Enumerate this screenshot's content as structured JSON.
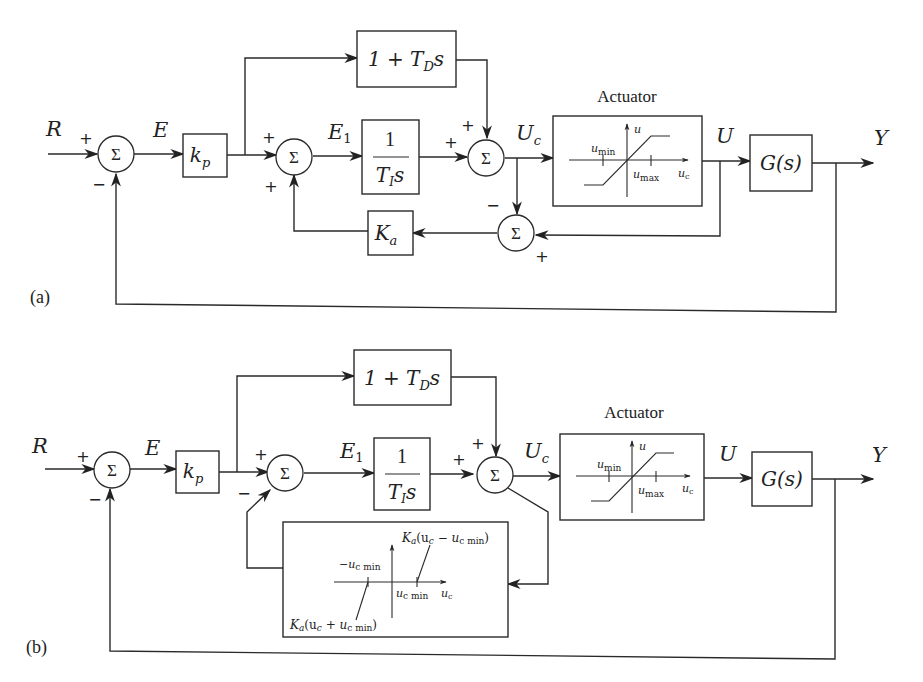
{
  "panels": [
    {
      "id": "a",
      "label": "(a)",
      "signals": {
        "input": "R",
        "error": "E",
        "error1": "E",
        "error1_sub": "1",
        "control": "U",
        "control_sub": "c",
        "actuator_out": "U",
        "output": "Y"
      },
      "blocks": {
        "gain": {
          "main": "k",
          "sub": "p"
        },
        "derivative": {
          "pre": "1 + T",
          "sub": "D",
          "post": "s"
        },
        "integrator": {
          "num": "1",
          "den": "T",
          "den_sub": "I",
          "den_post": "s"
        },
        "antiwindup": {
          "main": "K",
          "sub": "a"
        },
        "plant": "G(s)",
        "actuator": {
          "title": "Actuator",
          "y_axis": "u",
          "x_axis": "u",
          "x_axis_sub": "c",
          "min_label": "u",
          "min_sub": "min",
          "max_label": "u",
          "max_sub": "max"
        }
      },
      "sum_symbol": "Σ",
      "signs": {
        "sum1_in": "+",
        "sum1_fb": "−",
        "sum2_in": "+",
        "sum2_fb": "+",
        "sum3_in1": "+",
        "sum3_in2": "+",
        "sum4_uc": "−",
        "sum4_u": "+"
      }
    },
    {
      "id": "b",
      "label": "(b)",
      "signals": {
        "input": "R",
        "error": "E",
        "error1": "E",
        "error1_sub": "1",
        "control": "U",
        "control_sub": "c",
        "actuator_out": "U",
        "output": "Y"
      },
      "blocks": {
        "gain": {
          "main": "k",
          "sub": "p"
        },
        "derivative": {
          "pre": "1 + T",
          "sub": "D",
          "post": "s"
        },
        "integrator": {
          "num": "1",
          "den": "T",
          "den_sub": "I",
          "den_post": "s"
        },
        "plant": "G(s)",
        "actuator": {
          "title": "Actuator",
          "y_axis": "u",
          "x_axis": "u",
          "x_axis_sub": "c",
          "min_label": "u",
          "min_sub": "min",
          "max_label": "u",
          "max_sub": "max"
        },
        "deadzone": {
          "neg_tick": "−u",
          "neg_tick_sub": "c min",
          "pos_tick": "u",
          "pos_tick_sub": "c min",
          "x_axis": "u",
          "x_axis_sub": "c",
          "upper_label": "K",
          "upper_label_sub": "a",
          "upper_label_rest": "(u",
          "upper_label_rest_sub": "c",
          "upper_label_tail": " − u",
          "upper_label_tail_sub": "c min",
          "upper_label_close": ")",
          "lower_label": "K",
          "lower_label_sub": "a",
          "lower_label_rest": "(u",
          "lower_label_rest_sub": "c",
          "lower_label_tail": " + u",
          "lower_label_tail_sub": "c min",
          "lower_label_close": ")"
        }
      },
      "sum_symbol": "Σ",
      "signs": {
        "sum1_in": "+",
        "sum1_fb": "−",
        "sum2_in": "+",
        "sum2_fb": "−",
        "sum3_in1": "+",
        "sum3_in2": "+"
      }
    }
  ]
}
